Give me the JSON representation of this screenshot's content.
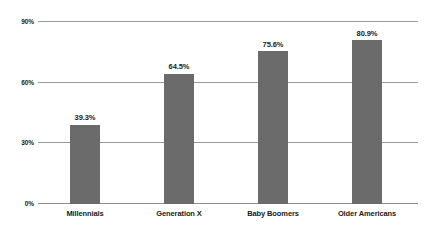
{
  "chart_data": {
    "type": "bar",
    "title": "",
    "subtitle": "",
    "xlabel": "",
    "ylabel": "",
    "categories": [
      "Millennials",
      "Generation X",
      "Baby Boomers",
      "Older Americans"
    ],
    "values": [
      39.3,
      64.5,
      75.6,
      80.9
    ],
    "value_labels": [
      "39.3%",
      "64.5%",
      "75.6%",
      "80.9%"
    ],
    "ylim": [
      0,
      90
    ],
    "yticks": [
      0,
      30,
      60,
      90
    ],
    "ytick_labels": [
      "0%",
      "30%",
      "60%",
      "90%"
    ],
    "grid": true,
    "legend": null,
    "series_color": "#6b6b6b",
    "gridline_color": "#9a9a9a",
    "text_color": "#1a1a1a",
    "background": "#ffffff"
  }
}
